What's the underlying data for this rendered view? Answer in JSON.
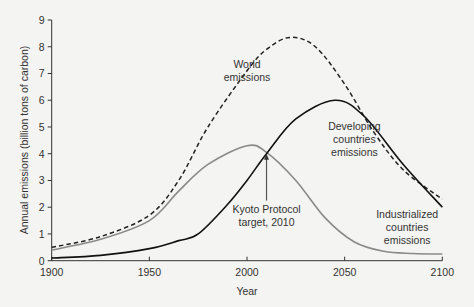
{
  "chart_data": {
    "type": "line",
    "title": "",
    "xlabel": "Year",
    "ylabel": "Annual emissions (billion tons of carbon)",
    "xlim": [
      1900,
      2100
    ],
    "ylim": [
      0,
      9
    ],
    "x_ticks": [
      1900,
      1950,
      2000,
      2050,
      2100
    ],
    "y_ticks": [
      0,
      1,
      2,
      3,
      4,
      5,
      6,
      7,
      8,
      9
    ],
    "grid": false,
    "legend": "none (inline annotations)",
    "series": [
      {
        "name": "World emissions",
        "style": "dashed",
        "color": "#222222",
        "x": [
          1900,
          1925,
          1950,
          1965,
          1980,
          2000,
          2010,
          2022,
          2035,
          2050,
          2065,
          2080,
          2100
        ],
        "values": [
          0.5,
          0.9,
          1.7,
          3.0,
          5.0,
          7.1,
          7.9,
          8.35,
          8.0,
          6.6,
          4.8,
          3.4,
          2.3
        ]
      },
      {
        "name": "Industrialized countries emissions",
        "style": "solid",
        "color": "#8a8a8a",
        "x": [
          1900,
          1925,
          1950,
          1965,
          1980,
          2000,
          2010,
          2025,
          2040,
          2055,
          2070,
          2085,
          2100
        ],
        "values": [
          0.4,
          0.8,
          1.5,
          2.6,
          3.6,
          4.3,
          4.05,
          3.0,
          1.6,
          0.7,
          0.35,
          0.27,
          0.25
        ]
      },
      {
        "name": "Developing countries emissions",
        "style": "solid",
        "color": "#111111",
        "x": [
          1900,
          1925,
          1950,
          1965,
          1975,
          1990,
          2000,
          2010,
          2025,
          2045,
          2060,
          2080,
          2100
        ],
        "values": [
          0.1,
          0.2,
          0.45,
          0.75,
          1.0,
          2.1,
          3.0,
          4.0,
          5.3,
          6.0,
          5.4,
          3.6,
          2.0
        ]
      }
    ],
    "annotations": [
      {
        "text": [
          "World",
          "emissions"
        ],
        "x": 2000,
        "y": 7.2
      },
      {
        "text": [
          "Developing",
          "countries",
          "emissions"
        ],
        "x": 2055,
        "y": 4.9
      },
      {
        "text": [
          "Kyoto Protocol",
          "target, 2010"
        ],
        "x": 2010,
        "y": 1.8,
        "arrow_to": {
          "x": 2010,
          "y": 4.0
        }
      },
      {
        "text": [
          "Industrialized",
          "countries",
          "emissions"
        ],
        "x": 2082,
        "y": 1.6
      }
    ]
  },
  "axis": {
    "x_title": "Year",
    "y_title": "Annual emissions (billion tons of carbon)"
  }
}
